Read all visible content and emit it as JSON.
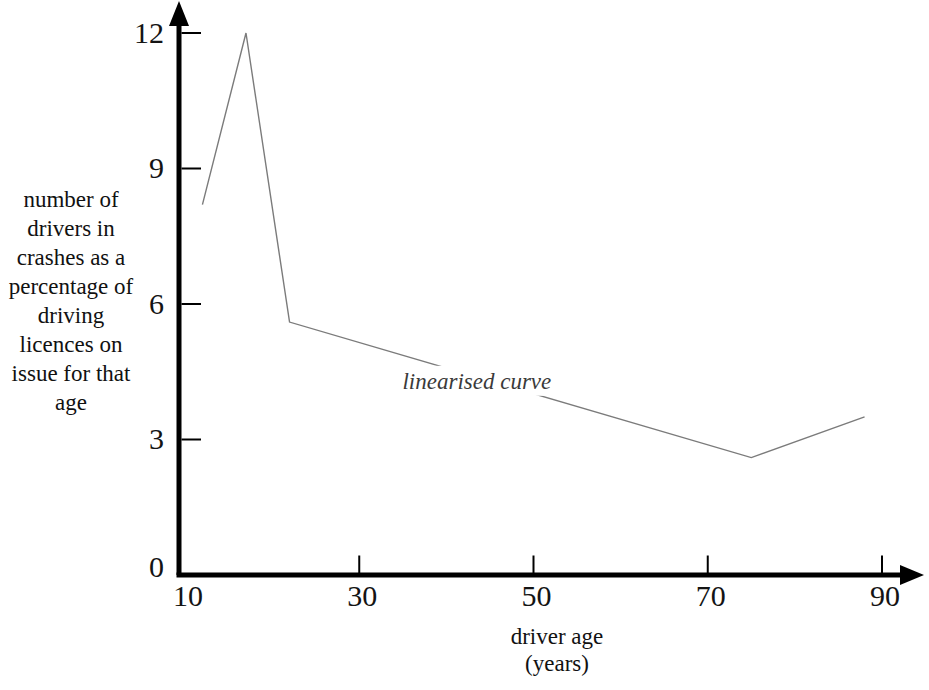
{
  "labels": {
    "ylabel_multiline": "number of\ndrivers in\ncrashes as a\npercentage of\ndriving\nlicences on\nissue for that\nage",
    "xlabel_multiline": "driver age\n(years)",
    "curve_label": "linearised curve"
  },
  "chart_data": {
    "type": "line",
    "title": "",
    "xlabel": "driver age (years)",
    "ylabel": "number of drivers in crashes as a percentage of driving licences on issue for that age",
    "x_ticks": [
      10,
      30,
      50,
      70,
      90
    ],
    "y_ticks": [
      0,
      3,
      6,
      9,
      12
    ],
    "x_ticks_with_mark": [
      30,
      50,
      70,
      90
    ],
    "y_ticks_with_mark": [
      3,
      6,
      9,
      12
    ],
    "xlim": [
      10,
      94
    ],
    "ylim": [
      0,
      12.8
    ],
    "grid": false,
    "legend": "none",
    "annotation": {
      "text": "linearised curve",
      "x": 43.5,
      "y": 4.3
    },
    "series": [
      {
        "name": "linearised curve",
        "points": [
          [
            12,
            8.2
          ],
          [
            17,
            12
          ],
          [
            22,
            5.6
          ],
          [
            75,
            2.6
          ],
          [
            88,
            3.5
          ]
        ]
      }
    ],
    "line_color": "#7b7b7b",
    "axis_color": "#000000"
  }
}
